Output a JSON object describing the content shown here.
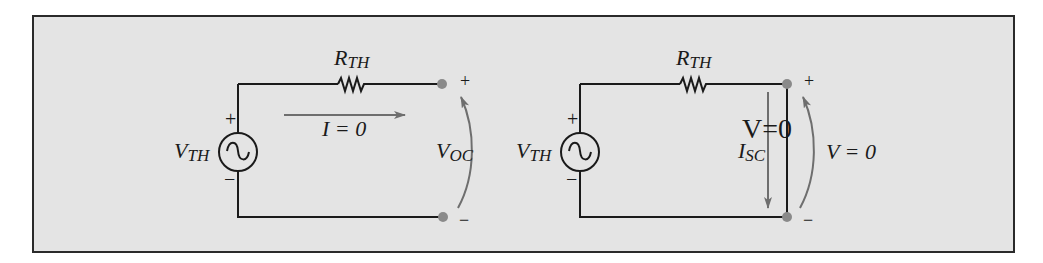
{
  "figure": {
    "background": "#e4e4e4",
    "border_color": "#2a2a2a",
    "wire_color": "#1a1a1a",
    "arrow_color": "#6e6e6e",
    "terminal_color": "#8a8a8a"
  },
  "left_circuit": {
    "title": "Open-circuit",
    "source_label": "V",
    "source_sub": "TH",
    "source_plus": "+",
    "source_minus": "−",
    "resistor_label": "R",
    "resistor_sub": "TH",
    "current_label": "I = 0",
    "voltage_label": "V",
    "voltage_sub": "OC",
    "terminal_plus": "+",
    "terminal_minus": "−"
  },
  "right_circuit": {
    "title": "Short-circuit",
    "source_label": "V",
    "source_sub": "TH",
    "source_plus": "+",
    "source_minus": "−",
    "resistor_label": "R",
    "resistor_sub": "TH",
    "short_label": "V=0",
    "current_label": "I",
    "current_sub": "SC",
    "voltage_label": "V = 0",
    "terminal_plus": "+",
    "terminal_minus": "−"
  }
}
